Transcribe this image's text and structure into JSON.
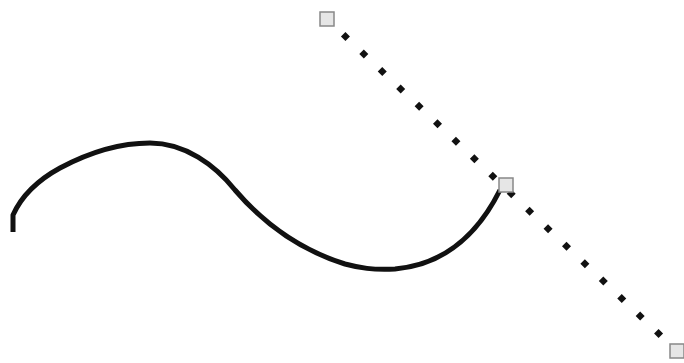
{
  "canvas": {
    "width": 684,
    "height": 363,
    "background": "#ffffff"
  },
  "curve": {
    "stroke": "#111111",
    "stroke_width": 5,
    "path": "M13,232 L13,215 C22,195 38,180 60,168 C90,152 120,143 150,143 C185,143 215,165 235,190 C265,225 300,250 345,264 C360,268 372,270 395,269 C440,265 475,240 500,190"
  },
  "handle_line": {
    "color": "#111111",
    "dot_size": 9,
    "start": [
      327,
      19
    ],
    "end": [
      677,
      351
    ],
    "dot_count": 19
  },
  "handles": [
    {
      "name": "control-handle-start",
      "x": 327,
      "y": 19
    },
    {
      "name": "anchor-point",
      "x": 506,
      "y": 185
    },
    {
      "name": "control-handle-end",
      "x": 677,
      "y": 351
    }
  ],
  "handle_style": {
    "size": 14,
    "fill": "#e6e6e6",
    "stroke": "#888888"
  }
}
